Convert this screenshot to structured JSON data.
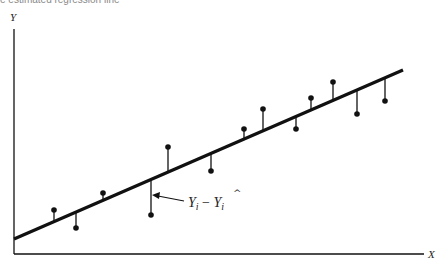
{
  "caption": "e estimated regression line",
  "axes": {
    "y_label": "Y",
    "x_label": "X"
  },
  "annotation": {
    "label_main": "Y",
    "label_sub": "i",
    "label_minus": " − ",
    "label_hat": "Y",
    "label_hat_sub": "i"
  },
  "colors": {
    "ink": "#111111",
    "caption": "#8a8a8a"
  },
  "regression_line": {
    "x1": 14,
    "y1": 239,
    "x2": 403,
    "y2": 70
  },
  "points": [
    {
      "x": 54,
      "y": 210
    },
    {
      "x": 76,
      "y": 228
    },
    {
      "x": 103,
      "y": 193
    },
    {
      "x": 151,
      "y": 215
    },
    {
      "x": 168,
      "y": 147
    },
    {
      "x": 211,
      "y": 171
    },
    {
      "x": 244,
      "y": 129
    },
    {
      "x": 263,
      "y": 109
    },
    {
      "x": 296,
      "y": 129
    },
    {
      "x": 311,
      "y": 98
    },
    {
      "x": 333,
      "y": 82
    },
    {
      "x": 357,
      "y": 114
    },
    {
      "x": 385,
      "y": 101
    }
  ]
}
